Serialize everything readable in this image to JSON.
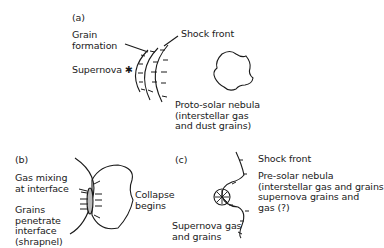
{
  "panel_a": {
    "tag": "(a)",
    "grain_formation": "Grain\nformation",
    "supernova": "Supernova ✱",
    "shock_front": "Shock front",
    "nebula": "Proto-solar nebula\n(interstellar gas\nand dust grains)"
  },
  "panel_b": {
    "tag": "(b)",
    "gas_mixing": "Gas mixing\nat interface",
    "grains": "Grains\npenetrate\ninterface\n(shrapnel)",
    "collapse": "Collapse\nbegins"
  },
  "panel_c": {
    "tag": "(c)",
    "shock_front": "Shock front",
    "pre_solar": "Pre-solar nebula\n(interstellar gas and grains\nsupernova grains and\ngas (?)",
    "supernova_gas": "Supernova gas\nand grains"
  }
}
